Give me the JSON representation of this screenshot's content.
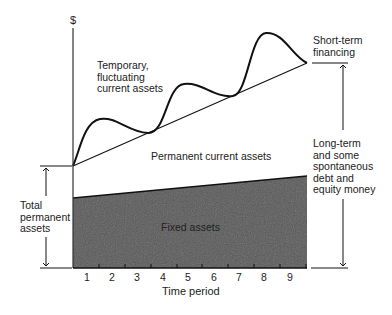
{
  "diagram": {
    "y_axis_label": "$",
    "x_axis_label": "Time period",
    "x_ticks": [
      "1",
      "2",
      "3",
      "4",
      "5",
      "6",
      "7",
      "8",
      "9"
    ],
    "regions": {
      "temporary": "Temporary,\nfluctuating\ncurrent assets",
      "permanent_current": "Permanent current assets",
      "fixed": "Fixed assets"
    },
    "left_bracket_label": "Total\npermanent\nassets",
    "right_top_label": "Short-term\nfinancing",
    "right_bottom_label": "Long-term\nand some\nspontaneous\ndebt and\nequity money",
    "colors": {
      "fixed_fill": "#5a5a5a",
      "line": "#111111",
      "background": "#ffffff"
    }
  }
}
